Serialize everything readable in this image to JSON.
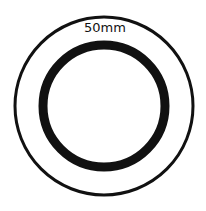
{
  "diagram": {
    "label": "50mm",
    "colors": {
      "background": "#ffffff",
      "stroke": "#111111"
    },
    "outer_ring": {
      "cx": 104,
      "cy": 106,
      "r": 89,
      "stroke_width": 3
    },
    "inner_ring": {
      "cx": 104,
      "cy": 106,
      "r": 61,
      "stroke_width": 9
    }
  }
}
